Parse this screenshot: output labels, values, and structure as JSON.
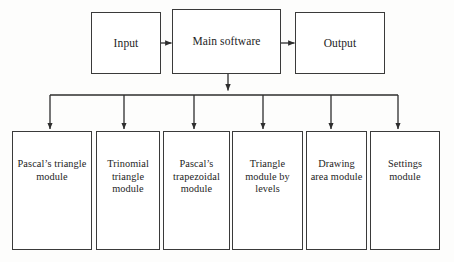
{
  "diagram": {
    "background_color": "#fdfdfc",
    "line_color": "#3a3a3a",
    "box_fill": "#ffffff",
    "text_color": "#1d1d1d",
    "top_row": [
      {
        "id": "input",
        "label": "Input"
      },
      {
        "id": "main-software",
        "label": "Main software"
      },
      {
        "id": "output",
        "label": "Output"
      }
    ],
    "modules": [
      {
        "id": "pascals-triangle-module",
        "label": "Pascal’s triangle module"
      },
      {
        "id": "trinomial-triangle-module",
        "label": "Trinomial triangle module"
      },
      {
        "id": "pascals-trapezoidal-module",
        "label": "Pascal’s trapezoidal module"
      },
      {
        "id": "triangle-module-by-levels",
        "label": "Triangle module by levels"
      },
      {
        "id": "drawing-area-module",
        "label": "Drawing area module"
      },
      {
        "id": "settings-module",
        "label": "Settings module"
      }
    ],
    "connectors": {
      "input_to_main": "arrow",
      "main_to_output": "arrow",
      "main_to_bus": "arrow",
      "bus_to_modules": "arrow"
    }
  }
}
